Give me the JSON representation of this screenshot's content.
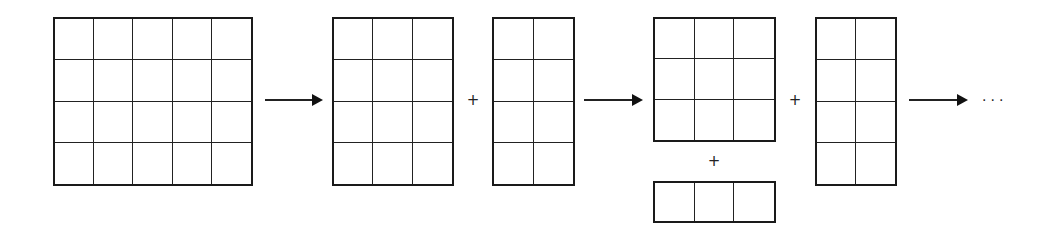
{
  "diagram": {
    "title": "",
    "grids": [
      {
        "id": "A",
        "cols": 5,
        "rows": 4,
        "x": 53,
        "y": 17,
        "w": 200,
        "h": 169
      },
      {
        "id": "B",
        "cols": 3,
        "rows": 4,
        "x": 332,
        "y": 17,
        "w": 122,
        "h": 169
      },
      {
        "id": "C",
        "cols": 2,
        "rows": 4,
        "x": 492,
        "y": 17,
        "w": 83,
        "h": 169
      },
      {
        "id": "D",
        "cols": 3,
        "rows": 3,
        "x": 653,
        "y": 17,
        "w": 123,
        "h": 125
      },
      {
        "id": "E",
        "cols": 3,
        "rows": 1,
        "x": 653,
        "y": 181,
        "w": 123,
        "h": 42
      },
      {
        "id": "F",
        "cols": 2,
        "rows": 4,
        "x": 815,
        "y": 17,
        "w": 82,
        "h": 169
      }
    ],
    "arrows": [
      {
        "x": 265,
        "y": 99,
        "w": 56
      },
      {
        "x": 584,
        "y": 99,
        "w": 57
      },
      {
        "x": 909,
        "y": 99,
        "w": 57
      }
    ],
    "plus_signs": [
      {
        "label": "+",
        "x": 473,
        "y": 100
      },
      {
        "label": "+",
        "x": 714,
        "y": 161
      },
      {
        "label": "+",
        "x": 795,
        "y": 100
      }
    ],
    "ellipsis": {
      "label": "···",
      "x": 982,
      "y": 100
    }
  }
}
